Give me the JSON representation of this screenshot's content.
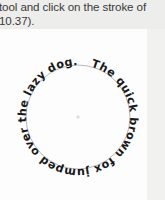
{
  "caption": {
    "line1": "tool and click on the stroke of",
    "line2": "10.37)."
  },
  "artboard": {
    "name": "artboard",
    "background_color": "#fdfdfd"
  },
  "circle_text": {
    "content": "The quick brown fox jumped over the lazy dog...",
    "shape": "circle",
    "text_color": "#18181a",
    "stroke_color": "#9a9a9a",
    "center_x": 78,
    "center_y": 88,
    "radius": 52,
    "start_offset_percent": 4
  },
  "colors": {
    "page_background": "#ececeb",
    "panel_background": "#fdfdfd",
    "caption_text": "#3a3a3a"
  }
}
